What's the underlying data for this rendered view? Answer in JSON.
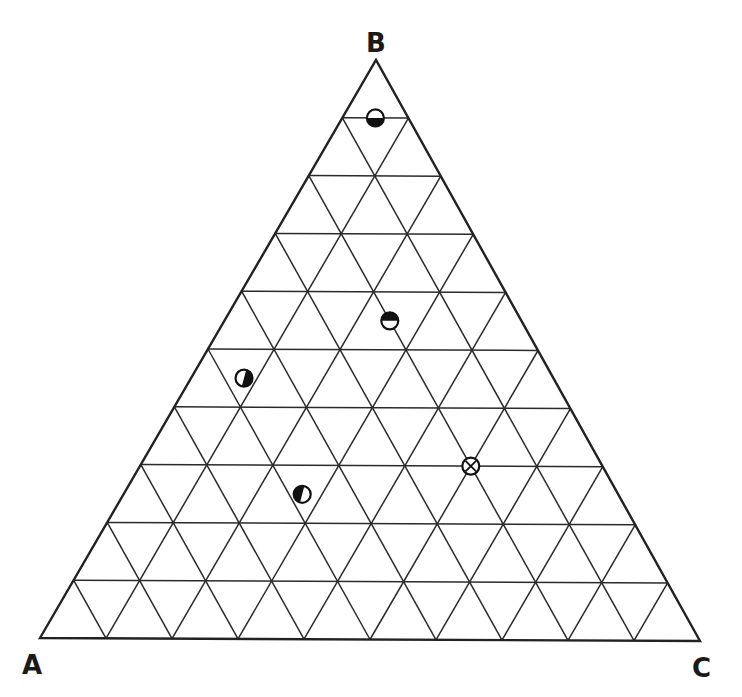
{
  "diagram": {
    "type": "ternary",
    "vertices": {
      "A": {
        "label": "A",
        "position": "bottom-left"
      },
      "B": {
        "label": "B",
        "position": "top"
      },
      "C": {
        "label": "C",
        "position": "bottom-right"
      }
    },
    "grid_divisions": 10,
    "colors": {
      "line": "#222222",
      "background": "#ffffff",
      "fill": "#111111"
    }
  },
  "chart_data": {
    "type": "scatter",
    "subtype": "ternary",
    "title": "",
    "axes": [
      "A",
      "B",
      "C"
    ],
    "grid": true,
    "grid_step": 0.1,
    "points": [
      {
        "id": 1,
        "marker": "half-filled-bottom",
        "A": 0.05,
        "B": 0.9,
        "C": 0.05
      },
      {
        "id": 2,
        "marker": "half-filled-top",
        "A": 0.2,
        "B": 0.55,
        "C": 0.25
      },
      {
        "id": 3,
        "marker": "half-filled-right",
        "A": 0.47,
        "B": 0.45,
        "C": 0.08
      },
      {
        "id": 4,
        "marker": "half-filled-left",
        "A": 0.48,
        "B": 0.25,
        "C": 0.27
      },
      {
        "id": 5,
        "marker": "circle-cross",
        "A": 0.2,
        "B": 0.3,
        "C": 0.5
      }
    ]
  }
}
